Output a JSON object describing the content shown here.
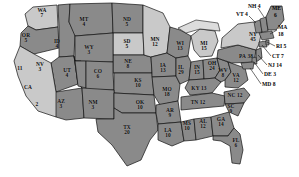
{
  "map": {
    "title": "United States Electoral College Map",
    "type": "choropleth-electoral-map",
    "background_color": "#ffffff",
    "palette": {
      "dark_fill": "#8a8a8a",
      "light_fill": "#c9c9c9",
      "pale_fill": "#dcdcdc",
      "border": "#111111",
      "label": "#0b0b0b",
      "leader_line": "#111111"
    },
    "legend_note": "",
    "shading_groups": [
      {
        "name": "dark",
        "color": "#8a8a8a"
      },
      {
        "name": "light",
        "color": "#c9c9c9"
      }
    ],
    "states": [
      {
        "abbr": "WA",
        "votes": "7",
        "shade": "light",
        "lx": 42,
        "ly": 13,
        "layout": "stacked"
      },
      {
        "abbr": "OR",
        "votes": "5",
        "shade": "dark",
        "lx": 26,
        "ly": 38,
        "layout": "stacked"
      },
      {
        "abbr": "ID",
        "votes": "4",
        "shade": "dark",
        "lx": 57,
        "ly": 44,
        "layout": "stacked"
      },
      {
        "abbr": "MT",
        "votes": "4",
        "shade": "dark",
        "lx": 84,
        "ly": 22,
        "layout": "stacked"
      },
      {
        "abbr": "ND",
        "votes": "5",
        "shade": "dark",
        "lx": 127,
        "ly": 22,
        "layout": "stacked"
      },
      {
        "abbr": "SD",
        "votes": "5",
        "shade": "light",
        "lx": 127,
        "ly": 44,
        "layout": "stacked"
      },
      {
        "abbr": "NE",
        "votes": "8",
        "shade": "dark",
        "lx": 128,
        "ly": 64,
        "layout": "stacked"
      },
      {
        "abbr": "WY",
        "votes": "3",
        "shade": "dark",
        "lx": 89,
        "ly": 50,
        "layout": "stacked"
      },
      {
        "abbr": "NV",
        "votes": "3",
        "shade": "dark",
        "lx": 40,
        "ly": 67,
        "layout": "stacked"
      },
      {
        "abbr": "UT",
        "votes": "4",
        "shade": "dark",
        "lx": 67,
        "ly": 73,
        "layout": "stacked"
      },
      {
        "abbr": "CO",
        "votes": "6",
        "shade": "dark",
        "lx": 98,
        "ly": 74,
        "layout": "stacked"
      },
      {
        "abbr": "KS",
        "votes": "10",
        "shade": "dark",
        "lx": 138,
        "ly": 83,
        "layout": "stacked"
      },
      {
        "abbr": "CA",
        "votes": "11",
        "shade": "light",
        "lx": 25,
        "ly": 77,
        "layout": "ca-special"
      },
      {
        "abbr": "AZ",
        "votes": "3",
        "shade": "dark",
        "lx": 61,
        "ly": 104,
        "layout": "stacked"
      },
      {
        "abbr": "NM",
        "votes": "3",
        "shade": "dark",
        "lx": 93,
        "ly": 105,
        "layout": "stacked"
      },
      {
        "abbr": "OK",
        "votes": "10",
        "shade": "dark",
        "lx": 140,
        "ly": 105,
        "layout": "stacked"
      },
      {
        "abbr": "TX",
        "votes": "20",
        "shade": "dark",
        "lx": 127,
        "ly": 130,
        "layout": "stacked"
      },
      {
        "abbr": "MN",
        "votes": "12",
        "shade": "light",
        "lx": 155,
        "ly": 42,
        "layout": "stacked"
      },
      {
        "abbr": "IA",
        "votes": "13",
        "shade": "dark",
        "lx": 163,
        "ly": 68,
        "layout": "stacked"
      },
      {
        "abbr": "MO",
        "votes": "18",
        "shade": "dark",
        "lx": 167,
        "ly": 92,
        "layout": "stacked"
      },
      {
        "abbr": "AR",
        "votes": "9",
        "shade": "dark",
        "lx": 170,
        "ly": 113,
        "layout": "stacked"
      },
      {
        "abbr": "LA",
        "votes": "10",
        "shade": "dark",
        "lx": 168,
        "ly": 133,
        "layout": "stacked"
      },
      {
        "abbr": "MS",
        "votes": "10",
        "shade": "dark",
        "lx": 187,
        "ly": 126,
        "layout": "stacked"
      },
      {
        "abbr": "AL",
        "votes": "12",
        "shade": "dark",
        "lx": 203,
        "ly": 124,
        "layout": "stacked"
      },
      {
        "abbr": "GA",
        "votes": "14",
        "shade": "dark",
        "lx": 221,
        "ly": 122,
        "layout": "stacked"
      },
      {
        "abbr": "FL",
        "votes": "6",
        "shade": "dark",
        "lx": 236,
        "ly": 143,
        "layout": "stacked"
      },
      {
        "abbr": "WI",
        "votes": "13",
        "shade": "dark",
        "lx": 180,
        "ly": 46,
        "layout": "stacked"
      },
      {
        "abbr": "MI",
        "votes": "15",
        "shade": "light",
        "lx": 204,
        "ly": 46,
        "layout": "stacked"
      },
      {
        "abbr": "IL",
        "votes": "29",
        "shade": "dark",
        "lx": 181,
        "ly": 70,
        "layout": "stacked"
      },
      {
        "abbr": "IN",
        "votes": "15",
        "shade": "dark",
        "lx": 197,
        "ly": 70,
        "layout": "stacked"
      },
      {
        "abbr": "OH",
        "votes": "24",
        "shade": "dark",
        "lx": 212,
        "ly": 66,
        "layout": "stacked"
      },
      {
        "abbr": "KY",
        "votes": "13",
        "shade": "dark",
        "lx": 199,
        "ly": 89,
        "layout": "inline"
      },
      {
        "abbr": "TN",
        "votes": "12",
        "shade": "dark",
        "lx": 198,
        "ly": 103,
        "layout": "inline"
      },
      {
        "abbr": "WV",
        "votes": "8",
        "shade": "dark",
        "lx": 223,
        "ly": 73,
        "layout": "stacked"
      },
      {
        "abbr": "VA",
        "votes": "12",
        "shade": "dark",
        "lx": 236,
        "ly": 78,
        "layout": "stacked"
      },
      {
        "abbr": "NC",
        "votes": "12",
        "shade": "dark",
        "lx": 235,
        "ly": 96,
        "layout": "inline"
      },
      {
        "abbr": "SC",
        "votes": "9",
        "shade": "dark",
        "lx": 231,
        "ly": 109,
        "layout": "stacked"
      },
      {
        "abbr": "PA",
        "votes": "38",
        "shade": "dark",
        "lx": 246,
        "ly": 57,
        "layout": "inline"
      },
      {
        "abbr": "NY",
        "votes": "45",
        "shade": "light",
        "lx": 253,
        "ly": 37,
        "layout": "stacked"
      }
    ],
    "callouts": [
      {
        "abbr": "NH",
        "votes": "4",
        "label": "NH 4",
        "tx": 248,
        "ty": 6,
        "align": "left",
        "line": [
          258,
          8,
          265,
          16
        ]
      },
      {
        "abbr": "VT",
        "votes": "4",
        "label": "VT 4",
        "tx": 236,
        "ty": 14,
        "align": "left",
        "line": [
          248,
          16,
          256,
          22
        ]
      },
      {
        "abbr": "ME",
        "votes": "6",
        "label": "ME",
        "tx": 272,
        "ty": 8,
        "align": "left",
        "line": null
      },
      {
        "abbr": "ME2",
        "votes": "6",
        "label": "6",
        "tx": 274,
        "ty": 15,
        "align": "left",
        "line": null
      },
      {
        "abbr": "MA",
        "votes": "18",
        "label": "MA",
        "tx": 278,
        "ty": 27,
        "align": "left",
        "line": [
          277,
          30,
          269,
          33
        ]
      },
      {
        "abbr": "MA2",
        "votes": "18",
        "label": "18",
        "tx": 278,
        "ty": 34,
        "align": "left",
        "line": null
      },
      {
        "abbr": "RI",
        "votes": "5",
        "label": "RI 5",
        "tx": 276,
        "ty": 46,
        "align": "left",
        "line": [
          275,
          47,
          266,
          41
        ]
      },
      {
        "abbr": "CT",
        "votes": "7",
        "label": "CT 7",
        "tx": 272,
        "ty": 56,
        "align": "left",
        "line": [
          271,
          56,
          262,
          44
        ]
      },
      {
        "abbr": "NJ",
        "votes": "14",
        "label": "NJ 14",
        "tx": 268,
        "ty": 65,
        "align": "left",
        "line": [
          267,
          64,
          257,
          53
        ]
      },
      {
        "abbr": "DE",
        "votes": "3",
        "label": "DE 3",
        "tx": 264,
        "ty": 74,
        "align": "left",
        "line": [
          263,
          73,
          252,
          62
        ]
      },
      {
        "abbr": "MD",
        "votes": "8",
        "label": "MD 8",
        "tx": 262,
        "ty": 84,
        "align": "left",
        "line": [
          261,
          83,
          248,
          68
        ]
      }
    ]
  }
}
